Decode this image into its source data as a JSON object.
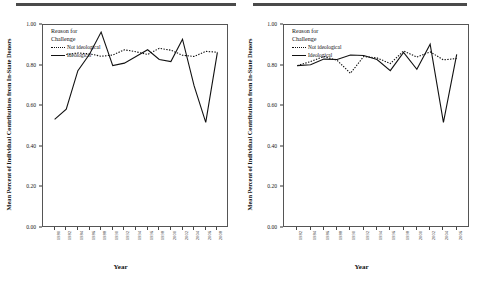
{
  "figure": {
    "panel_count": 2,
    "rule_color": "#4a4a4a"
  },
  "axes": {
    "ylabel": "Mean Percent of Individual Contributions from In-State Donors",
    "xlabel": "Year",
    "yticks": [
      "0.00",
      "0.20",
      "0.40",
      "0.60",
      "0.80",
      "1.00"
    ]
  },
  "legend": {
    "title_line1": "Reason for",
    "title_line2": "Challenge",
    "entries": [
      {
        "label": "Not ideological",
        "style": "dotted"
      },
      {
        "label": "Ideological",
        "style": "solid"
      }
    ]
  },
  "chart_data": [
    {
      "type": "line",
      "title": "",
      "xlabel": "Year",
      "ylabel": "Mean Percent of Individual Contributions from In-State Donors",
      "ylim": [
        0.0,
        1.0
      ],
      "grid": false,
      "legend_position": "top-left inside",
      "categories": [
        "1980",
        "1982",
        "1984",
        "1986",
        "1988",
        "1990",
        "1992",
        "1994",
        "1996",
        "1998",
        "2000",
        "2002",
        "2004",
        "2006",
        "2008"
      ],
      "series": [
        {
          "name": "Not ideological",
          "style": "dotted",
          "color": "#111111",
          "values": [
            null,
            0.855,
            0.862,
            0.858,
            0.846,
            0.852,
            0.878,
            0.868,
            0.855,
            0.885,
            0.876,
            0.851,
            0.845,
            0.87,
            0.866
          ]
        },
        {
          "name": "Ideological",
          "style": "solid",
          "color": "#111111",
          "values": [
            0.535,
            0.585,
            0.775,
            0.856,
            0.965,
            0.8,
            0.812,
            0.845,
            0.878,
            0.83,
            0.82,
            0.93,
            0.7,
            0.52,
            0.865
          ]
        }
      ],
      "annotations": [
        "Ideological series shows a deep dip near 2006 (~0.52) followed by sharp recovery",
        "Not ideological series remains nearly flat between 0.84 and 0.89"
      ]
    },
    {
      "type": "line",
      "title": "",
      "xlabel": "Year",
      "ylabel": "Mean Percent of Individual Contributions from In-State Donors",
      "ylim": [
        0.0,
        1.0
      ],
      "grid": false,
      "legend_position": "top-left inside",
      "categories": [
        "1982",
        "1984",
        "1986",
        "1988",
        "1990",
        "1992",
        "1994",
        "1996",
        "1998",
        "2000",
        "2002",
        "2004",
        "2006"
      ],
      "series": [
        {
          "name": "Not ideological",
          "style": "dotted",
          "color": "#111111",
          "values": [
            0.8,
            0.82,
            0.845,
            0.826,
            0.762,
            0.845,
            0.838,
            0.81,
            0.872,
            0.842,
            0.868,
            0.828,
            0.835
          ]
        },
        {
          "name": "Ideological",
          "style": "solid",
          "color": "#111111",
          "values": [
            0.8,
            0.804,
            0.832,
            0.83,
            0.852,
            0.85,
            0.83,
            0.775,
            0.865,
            0.782,
            0.905,
            0.52,
            0.855
          ]
        }
      ],
      "annotations": [
        "Ideological series dips sharply near 2004 (~0.52)",
        "Both series hover around 0.80-0.88 for most of the range"
      ]
    }
  ]
}
